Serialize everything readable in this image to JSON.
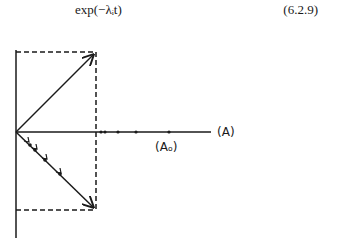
{
  "equation": {
    "expression": "exp(−λᵢt)",
    "number": "(6.2.9)"
  },
  "diagram": {
    "axis_label": "(A)",
    "point_label": "(Aₒ)"
  }
}
